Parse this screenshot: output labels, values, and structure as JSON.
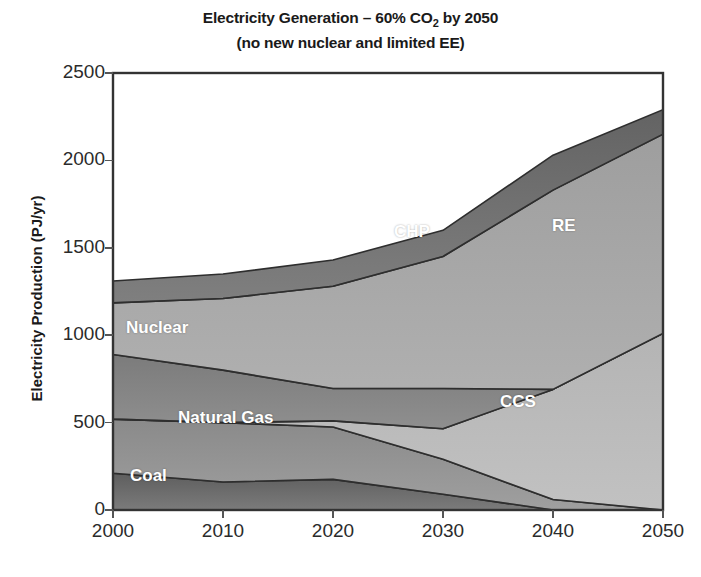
{
  "chart_data": {
    "type": "area",
    "stacked": true,
    "title": "Electricity Generation – 60% CO2 by 2050",
    "title_line1_prefix": "Electricity Generation – 60% CO",
    "title_line1_sub": "2",
    "title_line1_suffix": " by 2050",
    "subtitle": "(no new nuclear and limited EE)",
    "xlabel": "",
    "ylabel": "Electricity Production (PJ/yr)",
    "x": [
      2000,
      2010,
      2020,
      2030,
      2040,
      2050
    ],
    "xticklabels": [
      "2000",
      "2010",
      "2020",
      "2030",
      "2040",
      "2050"
    ],
    "yticks": [
      0,
      500,
      1000,
      1500,
      2000,
      2500
    ],
    "yticklabels": [
      "0",
      "500",
      "1000",
      "1500",
      "2000",
      "2500"
    ],
    "xlim": [
      2000,
      2050
    ],
    "ylim": [
      0,
      2500
    ],
    "grid": false,
    "legend": "inline-area-labels",
    "series": [
      {
        "name": "Coal",
        "color": "#5e5e5e",
        "values": [
          210,
          160,
          175,
          90,
          0,
          0
        ]
      },
      {
        "name": "Natural Gas",
        "color": "#8a8a8a",
        "values": [
          310,
          340,
          300,
          200,
          60,
          0
        ]
      },
      {
        "name": "CCS",
        "color": "#b4b4b4",
        "values": [
          0,
          0,
          35,
          175,
          630,
          1010
        ]
      },
      {
        "name": "Nuclear",
        "color": "#767676",
        "values": [
          370,
          300,
          185,
          230,
          0,
          0
        ]
      },
      {
        "name": "RE",
        "color": "#9e9e9e",
        "values": [
          295,
          410,
          585,
          755,
          1140,
          1140
        ]
      },
      {
        "name": "CHP",
        "color": "#636363",
        "values": [
          125,
          140,
          150,
          150,
          200,
          140
        ]
      }
    ],
    "area_labels": [
      {
        "text": "Coal",
        "x_px": 130,
        "y_px": 466
      },
      {
        "text": "Natural Gas",
        "x_px": 178,
        "y_px": 408
      },
      {
        "text": "Nuclear",
        "x_px": 126,
        "y_px": 318
      },
      {
        "text": "CHP",
        "x_px": 394,
        "y_px": 222
      },
      {
        "text": "CCS",
        "x_px": 500,
        "y_px": 392
      },
      {
        "text": "RE",
        "x_px": 552,
        "y_px": 216
      }
    ]
  },
  "axes": {
    "plot_left_px": 113,
    "plot_right_px": 663,
    "plot_top_px": 73,
    "plot_bottom_px": 510,
    "frame_color": "#333333"
  }
}
